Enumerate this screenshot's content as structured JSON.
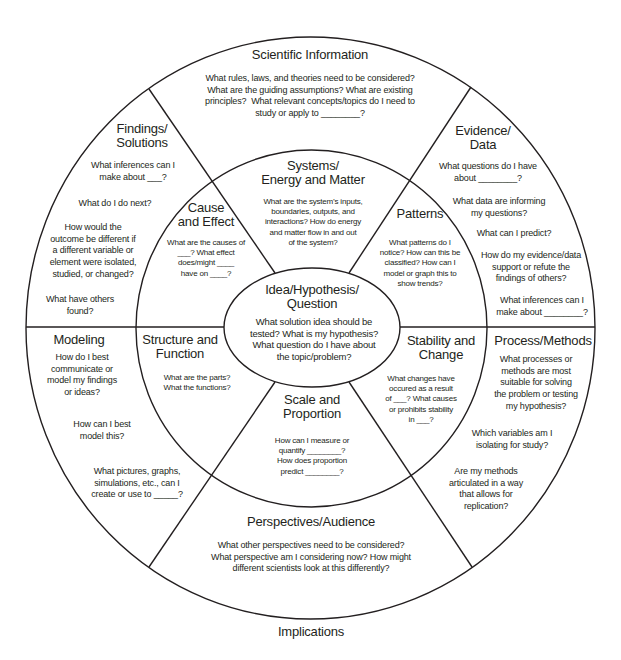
{
  "style": {
    "line_color": "#231f20",
    "text_color": "#231f20",
    "background": "#ffffff"
  },
  "outer_ring": {
    "scientific_information": {
      "title": "Scientific Information",
      "questions": [
        "What rules, laws, and theories need to be considered?\nWhat are the guiding assumptions? What are existing\nprinciples?  What relevant concepts/topics do I need to\nstudy or apply to ________?"
      ]
    },
    "evidence_data": {
      "title": "Evidence/\nData",
      "questions": [
        "What questions do I have\nabout ________?",
        "What data are informing\nmy questions?",
        "What can I predict?",
        "How do my evidence/data\nsupport or refute the\nfindings of others?",
        "What inferences can I\nmake about ________?"
      ]
    },
    "process_methods": {
      "title": "Process/Methods",
      "questions": [
        "What processes or\nmethods are most\nsuitable for solving\nthe problem or testing\nmy hypothesis?",
        "Which variables am I\nisolating for study?",
        "Are my methods\narticulated in a way\nthat allows for\nreplication?"
      ]
    },
    "perspectives_audience": {
      "title": "Perspectives/Audience",
      "questions": [
        "What other perspectives need to be considered?\nWhat perspective am I considering now? How might\ndifferent scientists look at this differently?"
      ]
    },
    "modeling": {
      "title": "Modeling",
      "questions": [
        "How do I best\ncommunicate or\nmodel my findings\nor ideas?",
        "How can I best\nmodel this?",
        "What pictures, graphs,\nsimulations, etc., can I\ncreate or use to _____?"
      ]
    },
    "findings_solutions": {
      "title": "Findings/\nSolutions",
      "questions": [
        "What inferences can I\nmake about ___?",
        "What do I do next?",
        "How would the\noutcome be different if\na different variable or\nelement were isolated,\nstudied, or changed?",
        "What have others\nfound?"
      ]
    }
  },
  "middle_ring": {
    "systems_energy_matter": {
      "title": "Systems/\nEnergy and Matter",
      "questions": [
        "What are the system’s inputs,\nboundaries, outputs, and\ninteractions? How do energy\nand matter flow in and out\nof the system?"
      ]
    },
    "patterns": {
      "title": "Patterns",
      "questions": [
        "What patterns do I\nnotice? How can this be\nclassified? How can I\nmodel or graph this to\nshow trends?"
      ]
    },
    "stability_change": {
      "title": "Stability and\nChange",
      "questions": [
        "What changes have\noccured as a result\nof ___? What causes\nor prohibits stability\nin ___?"
      ]
    },
    "scale_proportion": {
      "title": "Scale and\nProportion",
      "questions": [
        "How can I measure or\nquantify ________?\nHow does proportion\npredict ________?"
      ]
    },
    "structure_function": {
      "title": "Structure and\nFunction",
      "questions": [
        "What are the parts?\nWhat the functions?"
      ]
    },
    "cause_effect": {
      "title": "Cause\nand Effect",
      "questions": [
        "What are the causes of\n___? What effect\ndoes/might ____\nhave on ____?"
      ]
    }
  },
  "center": {
    "title": "Idea/Hypothesis/\nQuestion",
    "questions": [
      "What solution idea should be\ntested? What is my hypothesis?\nWhat question do I have about\nthe topic/problem?"
    ]
  },
  "footer": {
    "label": "Implications"
  }
}
